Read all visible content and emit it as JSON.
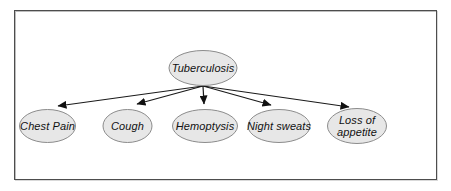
{
  "diagram": {
    "root": {
      "id": "tuberculosis",
      "label": "Tuberculosis"
    },
    "children": [
      {
        "id": "chest-pain",
        "label": "Chest Pain"
      },
      {
        "id": "cough",
        "label": "Cough"
      },
      {
        "id": "hemoptysis",
        "label": "Hemoptysis"
      },
      {
        "id": "night-sweats",
        "label": "Night sweats"
      },
      {
        "id": "loss-of-appetite",
        "label": "Loss of appetite"
      }
    ],
    "edges": [
      {
        "from": "Tuberculosis",
        "to": "Chest Pain"
      },
      {
        "from": "Tuberculosis",
        "to": "Cough"
      },
      {
        "from": "Tuberculosis",
        "to": "Hemoptysis"
      },
      {
        "from": "Tuberculosis",
        "to": "Night sweats"
      },
      {
        "from": "Tuberculosis",
        "to": "Loss of appetite"
      }
    ],
    "colors": {
      "node_fill": "#e7e7e7",
      "node_border": "#8c8c8c",
      "edge": "#1a1a1a",
      "frame_border": "#4d4d4d",
      "text": "#111111",
      "background": "#ffffff"
    }
  }
}
